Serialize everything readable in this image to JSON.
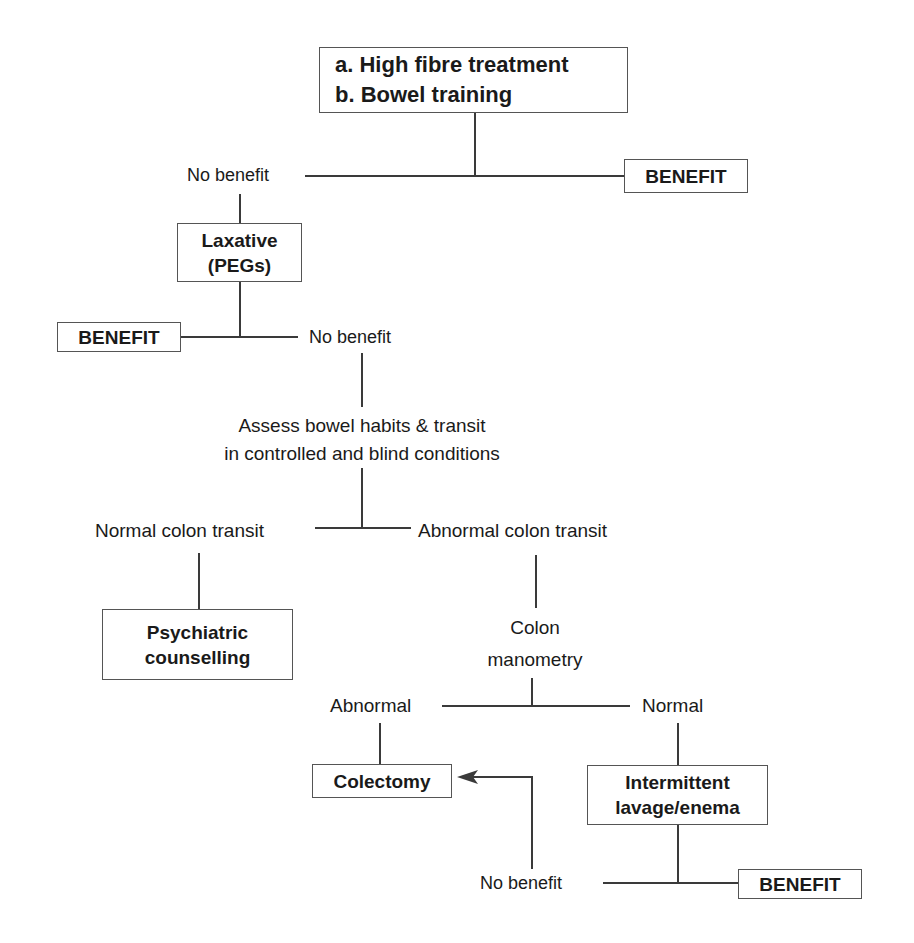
{
  "flowchart": {
    "start": {
      "line_a": "a. High fibre treatment",
      "line_b": "b. Bowel training"
    },
    "level1": {
      "no_benefit": "No benefit",
      "benefit": "BENEFIT"
    },
    "laxative": {
      "line1": "Laxative",
      "line2": "(PEGs)"
    },
    "level2": {
      "benefit": "BENEFIT",
      "no_benefit": "No benefit"
    },
    "assess": {
      "line1": "Assess bowel habits & transit",
      "line2": "in controlled and blind conditions"
    },
    "transit": {
      "normal": "Normal colon transit",
      "abnormal": "Abnormal colon transit"
    },
    "psychiatric": {
      "line1": "Psychiatric",
      "line2": "counselling"
    },
    "manometry": {
      "line1": "Colon",
      "line2": "manometry"
    },
    "manometry_result": {
      "abnormal": "Abnormal",
      "normal": "Normal"
    },
    "colectomy": "Colectomy",
    "lavage": {
      "line1": "Intermittent",
      "line2": "lavage/enema"
    },
    "level3": {
      "no_benefit": "No benefit",
      "benefit": "BENEFIT"
    }
  },
  "colors": {
    "line": "#3a3a3a",
    "box_border": "#555555",
    "text": "#1a1a1a"
  }
}
